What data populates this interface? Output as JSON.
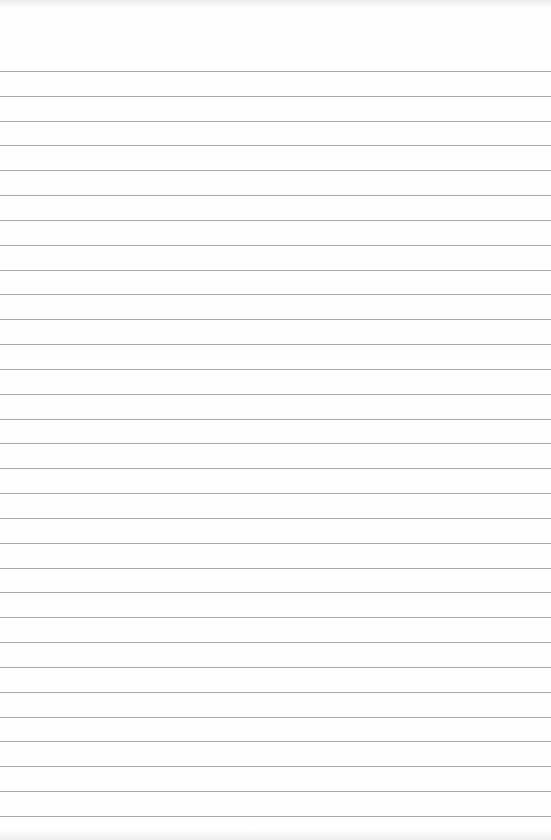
{
  "page": {
    "type": "lined-paper",
    "background_color": "#fefefe",
    "rule_color": "#9a9a9a",
    "first_rule_y": 71,
    "rule_spacing": 24.83,
    "rule_count": 31
  }
}
